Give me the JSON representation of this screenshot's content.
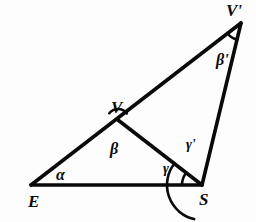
{
  "figure": {
    "type": "geometry-diagram",
    "background_color": "#fdfdfd",
    "stroke_color": "#0a0a0a"
  },
  "points": [
    {
      "id": "E",
      "label": "E",
      "x": 31,
      "y": 185
    },
    {
      "id": "S",
      "label": "S",
      "x": 202,
      "y": 185
    },
    {
      "id": "V",
      "label": "V",
      "x": 118,
      "y": 120
    },
    {
      "id": "Vp",
      "label": "V'",
      "x": 241,
      "y": 23
    }
  ],
  "point_labels": [
    {
      "name": "point-label-e",
      "text": "E",
      "x": 28,
      "y": 193,
      "size": "vertex"
    },
    {
      "name": "point-label-s",
      "text": "S",
      "x": 199,
      "y": 191,
      "size": "vertex"
    },
    {
      "name": "point-label-v",
      "text": "V",
      "x": 111,
      "y": 99,
      "size": "vertex"
    },
    {
      "name": "point-label-v-prime",
      "text": "V'",
      "x": 226,
      "y": 2,
      "size": "vertex"
    }
  ],
  "segments": [
    {
      "name": "segment-e-vprime",
      "from": "E",
      "to": "Vp",
      "width": 3.6
    },
    {
      "name": "segment-e-s",
      "from": "E",
      "to": "S",
      "width": 3.6
    },
    {
      "name": "segment-s-vprime",
      "from": "S",
      "to": "Vp",
      "width": 3.6
    },
    {
      "name": "segment-v-s",
      "from": "V",
      "to": "S",
      "width": 3.6
    }
  ],
  "angles": [
    {
      "name": "angle-alpha",
      "symbol": "α",
      "at": "E",
      "label_x": 56,
      "label_y": 167,
      "size": "angle",
      "has_arc": false
    },
    {
      "name": "angle-beta",
      "symbol": "β",
      "at": "V",
      "label_x": 110,
      "label_y": 141,
      "size": "angle",
      "has_arc": true,
      "arc_radius": 11,
      "arc_start_deg": 142,
      "arc_end_deg": 37
    },
    {
      "name": "angle-beta-prime",
      "symbol": "β'",
      "at": "Vp",
      "label_x": 216,
      "label_y": 52,
      "size": "angle",
      "has_arc": true,
      "arc_radius": 17,
      "arc_start_deg": 219,
      "arc_end_deg": 257
    },
    {
      "name": "angle-gamma",
      "symbol": "γ",
      "at": "S",
      "label_x": 163,
      "label_y": 162,
      "size": "angle-sm",
      "has_arc": true,
      "arc_radius": 20,
      "arc_start_deg": 180,
      "arc_end_deg": 142
    },
    {
      "name": "angle-gamma-prime",
      "symbol": "γ'",
      "at": "S",
      "label_x": 186,
      "label_y": 138,
      "size": "angle-sm",
      "has_arc": true,
      "arc_radius": 35,
      "arc_start_deg": 142,
      "arc_end_deg": 257
    }
  ]
}
